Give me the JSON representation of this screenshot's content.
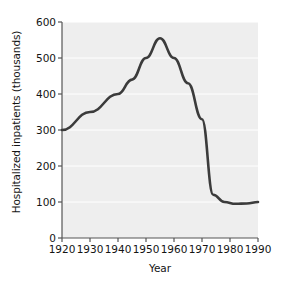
{
  "chart_data": {
    "type": "line",
    "title": "",
    "xlabel": "Year",
    "ylabel": "Hospitalized inpatients (thousands)",
    "xlim": [
      1920,
      1990
    ],
    "ylim": [
      0,
      600
    ],
    "xticks": [
      1920,
      1930,
      1940,
      1950,
      1960,
      1970,
      1980,
      1990
    ],
    "yticks": [
      0,
      100,
      200,
      300,
      400,
      500,
      600
    ],
    "grid": true,
    "grid_axis": "y",
    "legend": "none",
    "series": [
      {
        "name": "Hospitalized inpatients",
        "color": "#3b3b3b",
        "x": [
          1920,
          1930,
          1940,
          1945,
          1950,
          1955,
          1960,
          1965,
          1970,
          1974,
          1978,
          1982,
          1986,
          1990
        ],
        "values": [
          300,
          350,
          400,
          440,
          500,
          555,
          500,
          430,
          330,
          120,
          100,
          95,
          96,
          100
        ]
      }
    ]
  },
  "axes": {
    "x_tick_labels": [
      "1920",
      "1930",
      "1940",
      "1950",
      "1960",
      "1970",
      "1980",
      "1990"
    ],
    "y_tick_labels": [
      "0",
      "100",
      "200",
      "300",
      "400",
      "500",
      "600"
    ],
    "x_axis_title": "Year",
    "y_axis_title": "Hospitalized inpatients (thousands)"
  },
  "style": {
    "plot_background": "#eeeeee",
    "grid_color": "#ffffff",
    "line_color": "#3b3b3b",
    "axis_color": "#555555",
    "text_color": "#141414",
    "page_background": "#ffffff"
  }
}
